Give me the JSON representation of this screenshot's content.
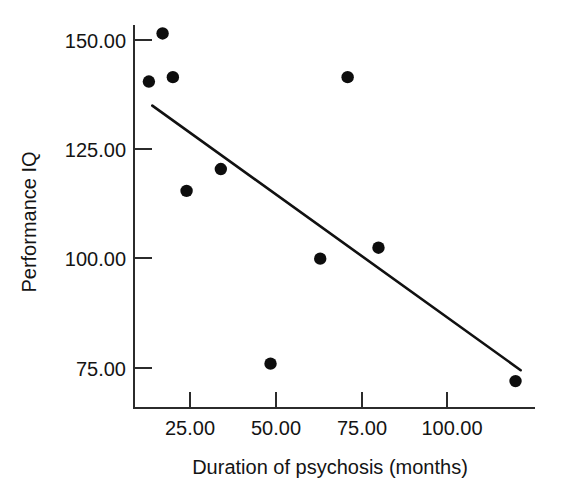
{
  "chart_data": {
    "type": "scatter",
    "title": "",
    "subtitle": "",
    "xlabel": "Duration of psychosis (months)",
    "ylabel": "Performance IQ",
    "xlim": [
      10,
      126
    ],
    "ylim": [
      66,
      155
    ],
    "grid": false,
    "legend": "none",
    "x_ticks": [
      25,
      50,
      75,
      100
    ],
    "x_tick_labels": [
      "25.00",
      "50.00",
      "75.00",
      "100.00"
    ],
    "y_ticks": [
      75,
      100,
      125,
      150
    ],
    "y_tick_labels": [
      "75.00",
      "100.00",
      "125.00",
      "150.00"
    ],
    "points": [
      {
        "x": 13,
        "y": 140.5
      },
      {
        "x": 17,
        "y": 151.5
      },
      {
        "x": 20,
        "y": 141.5
      },
      {
        "x": 24,
        "y": 115.5
      },
      {
        "x": 34,
        "y": 120.5
      },
      {
        "x": 48.5,
        "y": 76
      },
      {
        "x": 63,
        "y": 100
      },
      {
        "x": 71,
        "y": 141.5
      },
      {
        "x": 80,
        "y": 102.5
      },
      {
        "x": 120,
        "y": 72
      }
    ],
    "trend_line": {
      "name": "least-squares regression line",
      "x_start": 14,
      "y_start": 135,
      "x_end": 121.5,
      "y_end": 74.5
    }
  },
  "axis_labels": {
    "x_title": "Duration of psychosis (months)",
    "y_title": "Performance IQ"
  },
  "ticks": {
    "x": [
      "25.00",
      "50.00",
      "75.00",
      "100.00"
    ],
    "y": [
      "150.00",
      "125.00",
      "100.00",
      "75.00"
    ]
  },
  "colors": {
    "point": "#0d0d0d",
    "line": "#111111",
    "axis": "#2b2b2b",
    "text": "#141414",
    "background": "#ffffff"
  }
}
